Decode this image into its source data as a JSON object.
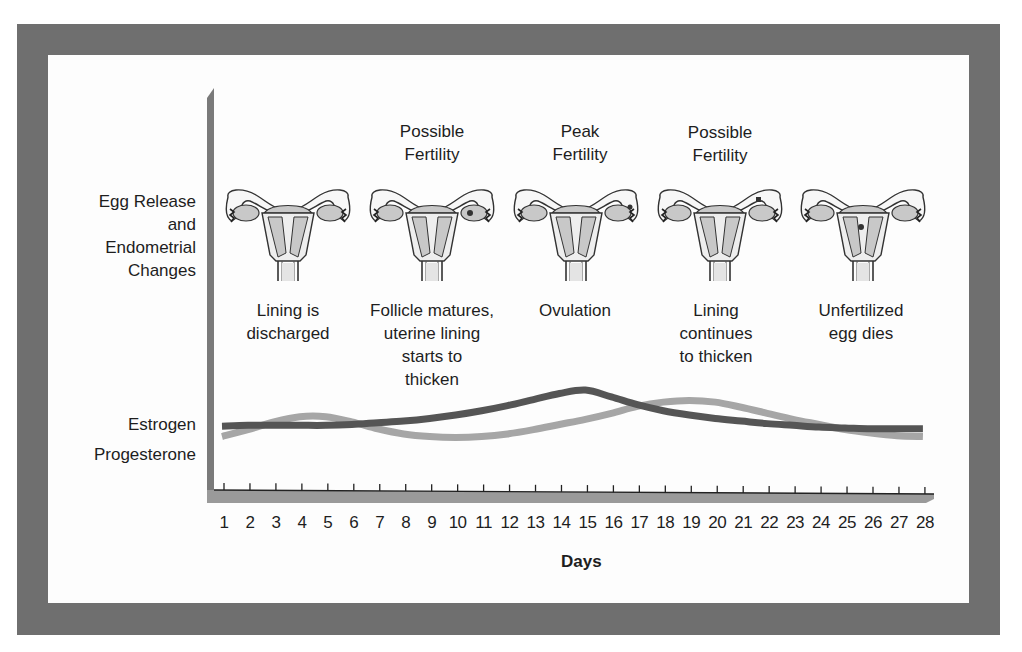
{
  "chart_data": {
    "type": "line",
    "title": "",
    "xlabel": "Days",
    "ylabel": "",
    "x": [
      1,
      2,
      3,
      4,
      5,
      6,
      7,
      8,
      9,
      10,
      11,
      12,
      13,
      14,
      15,
      16,
      17,
      18,
      19,
      20,
      21,
      22,
      23,
      24,
      25,
      26,
      27,
      28
    ],
    "xlim": [
      1,
      28
    ],
    "grid": false,
    "legend_position": "left labels",
    "series": [
      {
        "name": "Estrogen",
        "color": "#555555",
        "values": [
          30,
          31,
          31,
          31,
          31,
          32,
          34,
          36,
          39,
          43,
          48,
          54,
          61,
          68,
          72,
          64,
          55,
          48,
          43,
          39,
          36,
          33,
          31,
          29,
          28,
          27,
          27,
          27
        ]
      },
      {
        "name": "Progesterone",
        "color": "#a6a6a6",
        "values": [
          18,
          26,
          35,
          41,
          41,
          35,
          27,
          21,
          18,
          17,
          18,
          21,
          26,
          32,
          38,
          45,
          53,
          58,
          60,
          58,
          52,
          45,
          38,
          32,
          26,
          22,
          19,
          18
        ]
      }
    ],
    "row_labels": [
      "Egg Release and Endometrial Changes",
      "Estrogen",
      "Progesterone"
    ],
    "annotations": [
      {
        "day": 3.5,
        "fertility": "",
        "description": "Lining is discharged"
      },
      {
        "day": 9,
        "fertility": "Possible Fertility",
        "description": "Follicle matures, uterine lining starts to thicken"
      },
      {
        "day": 14.5,
        "fertility": "Peak Fertility",
        "description": "Ovulation"
      },
      {
        "day": 20,
        "fertility": "Possible Fertility",
        "description": "Lining continues to thicken"
      },
      {
        "day": 25.5,
        "fertility": "",
        "description": "Unfertilized egg dies"
      }
    ]
  },
  "labels": {
    "egg_release": [
      "Egg Release",
      "and",
      "Endometrial",
      "Changes"
    ],
    "estrogen": "Estrogen",
    "progesterone": "Progesterone",
    "days": "Days"
  },
  "phases": [
    {
      "title": [
        "",
        ""
      ],
      "desc": [
        "Lining is",
        "discharged"
      ]
    },
    {
      "title": [
        "Possible",
        "Fertility"
      ],
      "desc": [
        "Follicle matures,",
        "uterine lining",
        "starts to",
        "thicken"
      ]
    },
    {
      "title": [
        "Peak",
        "Fertility"
      ],
      "desc": [
        "Ovulation"
      ]
    },
    {
      "title": [
        "Possible",
        "Fertility"
      ],
      "desc": [
        "Lining",
        "continues",
        "to thicken"
      ]
    },
    {
      "title": [
        "",
        ""
      ],
      "desc": [
        "Unfertilized",
        "egg dies"
      ]
    }
  ],
  "xticks": [
    "1",
    "2",
    "3",
    "4",
    "5",
    "6",
    "7",
    "8",
    "9",
    "10",
    "11",
    "12",
    "13",
    "14",
    "15",
    "16",
    "17",
    "18",
    "19",
    "20",
    "21",
    "22",
    "23",
    "24",
    "25",
    "26",
    "27",
    "28"
  ],
  "colors": {
    "frame": "#6f6f6f",
    "axis": "#7a7a7a",
    "estrogen": "#555555",
    "progesterone": "#a6a6a6",
    "organ_fill": "#c8c8c8"
  }
}
